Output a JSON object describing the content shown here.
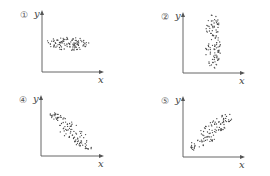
{
  "chart_data": [
    {
      "type": "scatter",
      "panel_label": "①",
      "xlabel": "x",
      "ylabel": "y",
      "shape": "horizontal ellipse",
      "correlation": "none",
      "origin": [
        42,
        72
      ],
      "cloud": {
        "cx": 67,
        "cy": 44,
        "rx": 22,
        "ry": 7,
        "angle": 0,
        "n": 110
      }
    },
    {
      "type": "scatter",
      "panel_label": "②",
      "xlabel": "x",
      "ylabel": "y",
      "shape": "vertical ellipse",
      "correlation": "none",
      "origin": [
        183,
        73
      ],
      "cloud": {
        "cx": 213,
        "cy": 42,
        "rx": 8,
        "ry": 28,
        "angle": 0,
        "n": 110
      }
    },
    {
      "type": "scatter",
      "panel_label": "④",
      "xlabel": "x",
      "ylabel": "y",
      "shape": "descending band",
      "correlation": "negative",
      "origin": [
        41,
        156
      ],
      "cloud": {
        "cx": 71,
        "cy": 131,
        "rx": 27,
        "ry": 8,
        "angle": 40,
        "n": 110
      }
    },
    {
      "type": "scatter",
      "panel_label": "⑤",
      "xlabel": "x",
      "ylabel": "y",
      "shape": "ascending band",
      "correlation": "positive",
      "origin": [
        183,
        157
      ],
      "cloud": {
        "cx": 211,
        "cy": 132,
        "rx": 27,
        "ry": 8,
        "angle": -40,
        "n": 110
      }
    }
  ],
  "axes": [
    {
      "yTop": 10,
      "xRight": 104
    },
    {
      "yTop": 12,
      "xRight": 245
    },
    {
      "yTop": 95,
      "xRight": 104
    },
    {
      "yTop": 96,
      "xRight": 245
    }
  ],
  "colors": {
    "axis": "#555555",
    "dot": "#444444",
    "label": "#555555"
  }
}
